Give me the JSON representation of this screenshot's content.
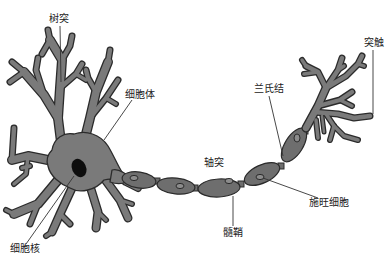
{
  "figure": {
    "background": "#ffffff",
    "cell_fill": "#7a7a7a",
    "outline": "#2b2b2b",
    "nucleus_fill": "#0d0d0d"
  },
  "labels": {
    "dendrite": "树突",
    "cell_body": "细胞体",
    "nucleus": "细胞核",
    "axon": "轴突",
    "myelin_sheath": "髓鞘",
    "schwann_cell": "施旺细胞",
    "node_of_ranvier": "兰氏结",
    "synapse": "突触"
  },
  "structure": {
    "myelin_segments": 6,
    "parts": [
      "树突",
      "细胞体",
      "细胞核",
      "轴突",
      "髓鞘",
      "施旺细胞",
      "兰氏结",
      "突触"
    ]
  }
}
